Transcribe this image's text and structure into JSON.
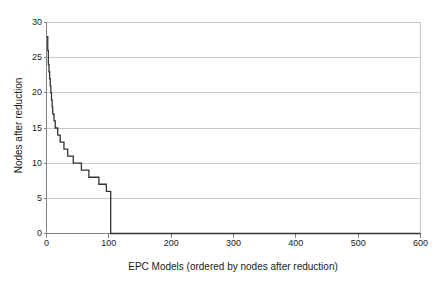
{
  "chart_data": {
    "type": "line",
    "title": "",
    "xlabel": "EPC Models (ordered by nodes after reduction)",
    "ylabel": "Nodes after reduction",
    "xlim": [
      0,
      600
    ],
    "ylim": [
      0,
      30
    ],
    "xticks": [
      0,
      100,
      200,
      300,
      400,
      500,
      600
    ],
    "yticks": [
      0,
      5,
      10,
      15,
      20,
      25,
      30
    ],
    "grid": "horizontal",
    "legend": "none",
    "line_color": "#333333",
    "grid_color": "#c8c8c8",
    "axis_color": "#808080",
    "background": "#ffffff",
    "series": [
      {
        "name": "Nodes after reduction",
        "x": [
          0,
          1,
          2,
          3,
          4,
          5,
          6,
          7,
          8,
          9,
          10,
          11,
          12,
          13,
          14,
          15,
          16,
          17,
          18,
          19,
          20,
          22,
          24,
          26,
          28,
          30,
          32,
          34,
          36,
          38,
          40,
          43,
          46,
          49,
          52,
          56,
          60,
          64,
          68,
          72,
          76,
          80,
          84,
          88,
          92,
          96,
          100,
          103,
          103,
          110,
          200,
          300,
          400,
          500,
          600
        ],
        "y": [
          28,
          28,
          26,
          24,
          23,
          22,
          21,
          20,
          19,
          18,
          17,
          17,
          16,
          16,
          15,
          15,
          15,
          15,
          14,
          14,
          14,
          13,
          13,
          13,
          12,
          12,
          12,
          11,
          11,
          11,
          11,
          10,
          10,
          10,
          10,
          9,
          9,
          9,
          8,
          8,
          8,
          8,
          7,
          7,
          7,
          6,
          6,
          6,
          0,
          0,
          0,
          0,
          0,
          0,
          0
        ]
      }
    ]
  }
}
